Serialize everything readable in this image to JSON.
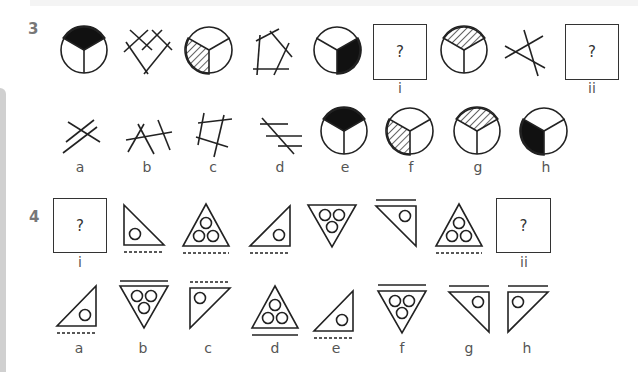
{
  "questions": [
    {
      "number": "3",
      "sequence": [
        {
          "figure": "circle-three-sector-top-black"
        },
        {
          "figure": "crossed-lines-heart-shape"
        },
        {
          "figure": "circle-three-sector-left-hatched"
        },
        {
          "figure": "crossed-lines-pentagon"
        },
        {
          "figure": "circle-three-sector-right-black"
        },
        {
          "figure": "missing-box",
          "text": "?",
          "label": "i"
        },
        {
          "figure": "circle-three-sector-top-hatched"
        },
        {
          "figure": "crossed-lines-triangle"
        },
        {
          "figure": "missing-box",
          "text": "?",
          "label": "ii"
        }
      ],
      "options": [
        {
          "label": "a",
          "figure": "crossed-lines-four"
        },
        {
          "label": "b",
          "figure": "crossed-lines-four-b"
        },
        {
          "label": "c",
          "figure": "crossed-lines-quad"
        },
        {
          "label": "d",
          "figure": "parallel-lines-cut"
        },
        {
          "label": "e",
          "figure": "circle-three-sector-top-black"
        },
        {
          "label": "f",
          "figure": "circle-three-sector-left-hatched"
        },
        {
          "label": "g",
          "figure": "circle-three-sector-top-hatched"
        },
        {
          "label": "h",
          "figure": "circle-three-sector-left-black"
        }
      ]
    },
    {
      "number": "4",
      "sequence": [
        {
          "figure": "missing-box",
          "text": "?",
          "label": "i"
        },
        {
          "figure": "right-triangle-left-one-circle-dashed-below"
        },
        {
          "figure": "triangle-up-three-circles-dashed-below"
        },
        {
          "figure": "right-triangle-right-one-circle-dashed-below"
        },
        {
          "figure": "triangle-down-three-circles"
        },
        {
          "figure": "right-triangle-down-one-circle-line-above"
        },
        {
          "figure": "triangle-up-three-circles-dashed-below"
        },
        {
          "figure": "missing-box",
          "text": "?",
          "label": "ii"
        }
      ],
      "options": [
        {
          "label": "a",
          "figure": "right-triangle-right-one-circle-dashed-below"
        },
        {
          "label": "b",
          "figure": "triangle-down-three-circles-line-above"
        },
        {
          "label": "c",
          "figure": "right-triangle-down-left-one-circle-dashed-above"
        },
        {
          "label": "d",
          "figure": "triangle-up-three-circles-line-below"
        },
        {
          "label": "e",
          "figure": "right-triangle-right-one-circle-dashed-below"
        },
        {
          "label": "f",
          "figure": "triangle-down-three-circles-line-above"
        },
        {
          "label": "g",
          "figure": "right-triangle-down-one-circle-line-above"
        },
        {
          "label": "h",
          "figure": "right-triangle-down-left-one-circle-line-above"
        }
      ]
    }
  ]
}
